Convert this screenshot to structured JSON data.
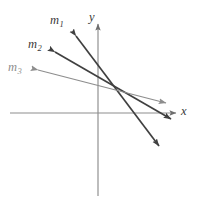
{
  "figure": {
    "type": "coordinate-plane-line-diagram",
    "width": 198,
    "height": 203,
    "background": "#ffffff"
  },
  "axes": {
    "color": "#8d8d8d",
    "x_axis": {
      "label": "x",
      "label_x": 181,
      "label_y": 105,
      "start_x": 10,
      "end_x": 176,
      "y": 113,
      "arrow": "right"
    },
    "y_axis": {
      "label": "y",
      "label_x": 89,
      "label_y": 11,
      "x": 98,
      "start_y": 196,
      "end_y": 24,
      "arrow": "up"
    },
    "origin": {
      "x": 98,
      "y": 113
    }
  },
  "chart_data": {
    "type": "line",
    "title": "",
    "xlabel": "x",
    "ylabel": "y",
    "grid": false,
    "legend": "inline-labels",
    "common_point": {
      "x": 110,
      "y": 88
    },
    "series": [
      {
        "name": "m_1",
        "label_text": "m",
        "label_sub": "1",
        "color": "#404040",
        "slope_description": "steepest-negative",
        "label_x": 50,
        "label_y": 14,
        "x1": 76,
        "y1": 36,
        "x2": 159,
        "y2": 146,
        "double_headed": true
      },
      {
        "name": "m_2",
        "label_text": "m",
        "label_sub": "2",
        "color": "#404040",
        "slope_description": "medium-negative",
        "label_x": 28,
        "label_y": 38,
        "x1": 55,
        "y1": 52,
        "x2": 171,
        "y2": 119,
        "double_headed": true
      },
      {
        "name": "m_3",
        "label_text": "m",
        "label_sub": "3",
        "color": "#8d8d8d",
        "slope_description": "shallowest-negative",
        "label_x": 8,
        "label_y": 61,
        "x1": 38,
        "y1": 70,
        "x2": 166,
        "y2": 103,
        "double_headed": true
      }
    ]
  }
}
